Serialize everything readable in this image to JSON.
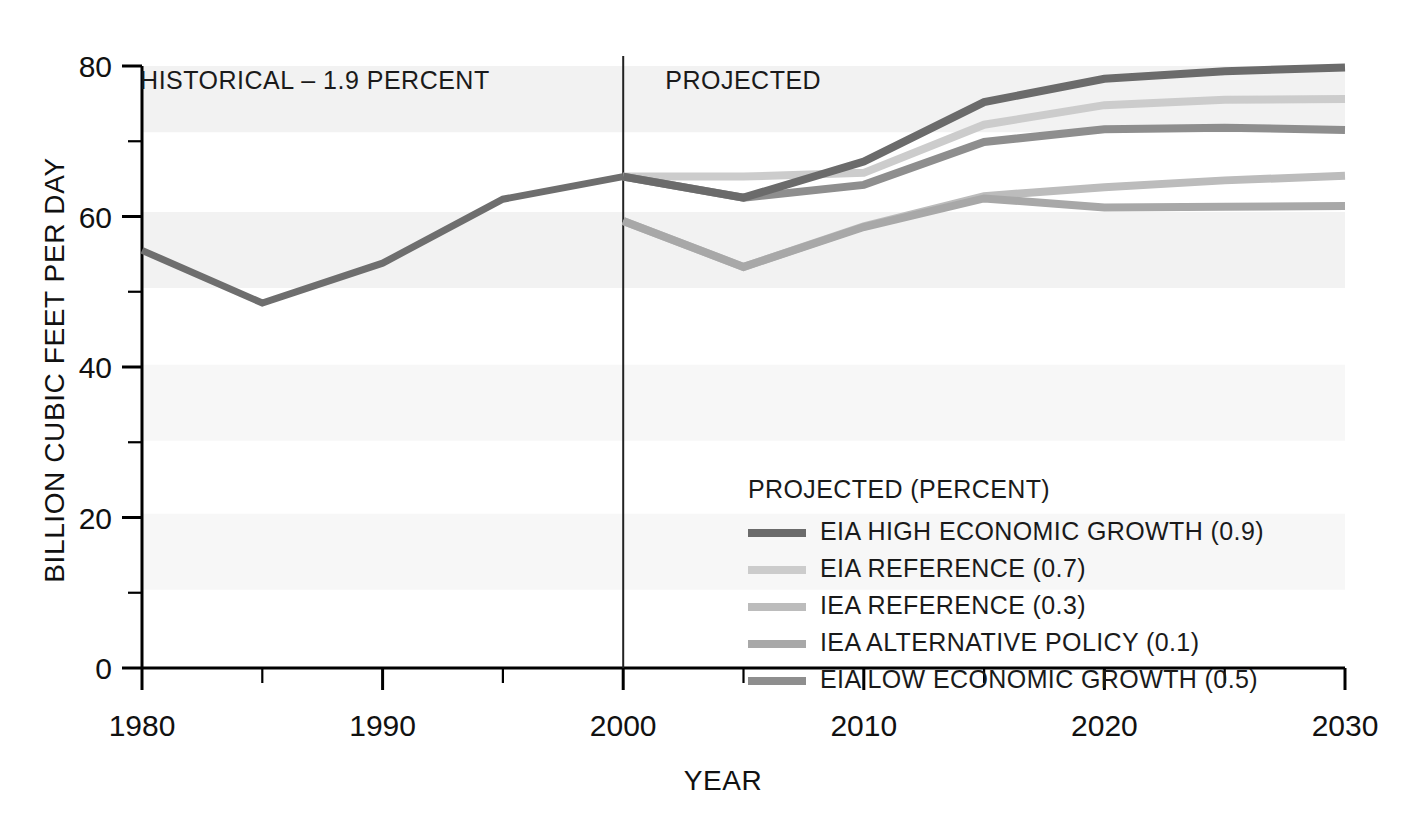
{
  "chart_data": {
    "type": "line",
    "title": "",
    "xlabel": "YEAR",
    "ylabel": "BILLION CUBIC FEET PER DAY",
    "xlim": [
      1980,
      2030
    ],
    "ylim": [
      0,
      80
    ],
    "grid": false,
    "legend_position": "inside-bottom-right",
    "x_ticks_major": [
      "1980",
      "1990",
      "2000",
      "2010",
      "2020",
      "2030"
    ],
    "x_ticks_major_values": [
      1980,
      1990,
      2000,
      2010,
      2020,
      2030
    ],
    "x_ticks_minor_values": [
      1985,
      1995,
      2005,
      2015,
      2025
    ],
    "y_ticks_major": [
      "0",
      "20",
      "40",
      "60",
      "80"
    ],
    "y_ticks_major_values": [
      0,
      20,
      40,
      60,
      80
    ],
    "y_ticks_minor_values": [
      10,
      30,
      50,
      70
    ],
    "divider_year": 2000,
    "annotations": [
      {
        "name": "historical-label",
        "text": "HISTORICAL – 1.9 PERCENT",
        "x": 1995.2,
        "y": 77.0
      },
      {
        "name": "projected-label",
        "text": "PROJECTED",
        "x": 2001.0,
        "y": 77.0
      }
    ],
    "legend_title": "PROJECTED (PERCENT)",
    "historical": {
      "name": "HISTORICAL",
      "color": "#6e6e6e",
      "width": 7,
      "x": [
        1980,
        1985,
        1990,
        1995,
        2000
      ],
      "values": [
        55.5,
        48.5,
        53.8,
        62.3,
        65.3
      ]
    },
    "series": [
      {
        "name": "EIA HIGH ECONOMIC GROWTH (0.9)",
        "label": "EIA HIGH ECONOMIC GROWTH (0.9)",
        "percent": "0.9",
        "color": "#6b6b6b",
        "width": 8,
        "x": [
          2000,
          2005,
          2010,
          2015,
          2020,
          2025,
          2030
        ],
        "values": [
          65.3,
          62.5,
          67.3,
          75.2,
          78.3,
          79.3,
          79.8
        ]
      },
      {
        "name": "EIA REFERENCE (0.7)",
        "label": "EIA REFERENCE (0.7)",
        "percent": "0.7",
        "color": "#cccccc",
        "width": 8,
        "x": [
          2000,
          2005,
          2010,
          2015,
          2020,
          2025,
          2030
        ],
        "values": [
          65.3,
          65.3,
          65.8,
          72.2,
          74.8,
          75.5,
          75.6
        ]
      },
      {
        "name": "IEA REFERENCE (0.3)",
        "label": "IEA REFERENCE (0.3)",
        "percent": "0.3",
        "color": "#bcbcbc",
        "width": 8,
        "x": [
          2000,
          2005,
          2010,
          2015,
          2020,
          2025,
          2030
        ],
        "values": [
          59.4,
          53.3,
          58.7,
          62.7,
          63.9,
          64.8,
          65.4
        ]
      },
      {
        "name": "IEA ALTERNATIVE POLICY (0.1)",
        "label": "IEA ALTERNATIVE POLICY (0.1)",
        "percent": "0.1",
        "color": "#a8a8a8",
        "width": 8,
        "x": [
          2000,
          2005,
          2010,
          2015,
          2020,
          2025,
          2030
        ],
        "values": [
          59.4,
          53.3,
          58.6,
          62.4,
          61.2,
          61.3,
          61.4
        ]
      },
      {
        "name": "EIA LOW ECONOMIC GROWTH (0.5)",
        "label": "EIA LOW ECONOMIC GROWTH (0.5)",
        "percent": "0.5",
        "color": "#8e8e8e",
        "width": 8,
        "x": [
          2000,
          2005,
          2010,
          2015,
          2020,
          2025,
          2030
        ],
        "values": [
          65.3,
          62.5,
          64.2,
          69.9,
          71.6,
          71.8,
          71.5
        ]
      }
    ],
    "background_bands": [
      {
        "y0": 71.2,
        "y1": 80.0,
        "color": "#f2f2f2"
      },
      {
        "y0": 50.5,
        "y1": 60.6,
        "color": "#f2f2f2"
      },
      {
        "y0": 30.2,
        "y1": 40.3,
        "color": "#f7f7f7"
      },
      {
        "y0": 10.4,
        "y1": 20.5,
        "color": "#f7f7f7"
      }
    ]
  },
  "colors": {
    "axis": "#000000",
    "text": "#111111",
    "divider": "#222222",
    "background": "#ffffff"
  }
}
